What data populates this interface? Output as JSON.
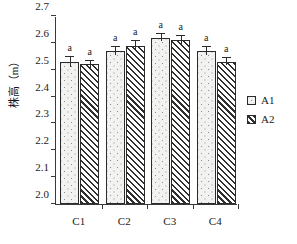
{
  "chart_data": {
    "type": "bar",
    "title": "",
    "xlabel": "",
    "ylabel": "株高（m）",
    "categories": [
      "C1",
      "C2",
      "C3",
      "C4"
    ],
    "ylim": [
      2.0,
      2.7
    ],
    "ytick_labels": [
      "2.0",
      "2.1",
      "2.2",
      "2.3",
      "2.4",
      "2.5",
      "2.6",
      "2.7"
    ],
    "ytick_values": [
      2.0,
      2.1,
      2.2,
      2.3,
      2.4,
      2.5,
      2.6,
      2.7
    ],
    "grid": false,
    "legend_position": "right",
    "series": [
      {
        "name": "A1",
        "pattern": "dotted",
        "values": [
          2.53,
          2.57,
          2.62,
          2.57
        ],
        "errors": [
          0.018,
          0.014,
          0.014,
          0.014
        ],
        "annotations": [
          "a",
          "a",
          "a",
          "a"
        ]
      },
      {
        "name": "A2",
        "pattern": "diagonal-hatch",
        "values": [
          2.52,
          2.59,
          2.61,
          2.53
        ],
        "errors": [
          0.014,
          0.018,
          0.014,
          0.014
        ],
        "annotations": [
          "a",
          "a",
          "a",
          "a"
        ]
      }
    ]
  },
  "legend": {
    "items": [
      {
        "label": "A1"
      },
      {
        "label": "A2"
      }
    ]
  },
  "colors": {
    "axis": "#3a3a3a",
    "bar_border": "#2b2b2b",
    "a1_fill": "#f2f2f0",
    "a2_fill": "#ffffff",
    "text": "#1a1a1a"
  }
}
